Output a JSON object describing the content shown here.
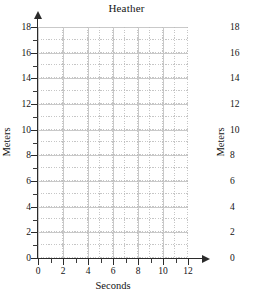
{
  "chart_data": {
    "type": "line",
    "title": "Heather",
    "xlabel": "Seconds",
    "ylabel": "Meters",
    "ylabel_right": "Meters",
    "xlim": [
      0,
      12
    ],
    "ylim": [
      0,
      18
    ],
    "x_major_tick_step": 2,
    "x_minor_tick_step": 1,
    "y_major_tick_step": 2,
    "y_minor_tick_step": 1,
    "grid": true,
    "grid_minor": true,
    "legend": null,
    "series": [],
    "values": [],
    "x": [],
    "categories": [],
    "annotations": [],
    "note": "Empty blank grid; no data plotted",
    "x_tick_labels": [
      "0",
      "2",
      "4",
      "6",
      "8",
      "10",
      "12"
    ],
    "x_tick_values": [
      0,
      2,
      4,
      6,
      8,
      10,
      12
    ],
    "y_tick_labels": [
      "0",
      "2",
      "4",
      "6",
      "8",
      "10",
      "12",
      "14",
      "16",
      "18"
    ],
    "y_tick_values": [
      0,
      2,
      4,
      6,
      8,
      10,
      12,
      14,
      16,
      18
    ],
    "colors": {
      "background": "#ffffff",
      "axis": "#2b2b2b",
      "grid_major": "#c9c9c9",
      "grid_minor": "#bdbdbd",
      "text": "#131313"
    }
  },
  "chart": {
    "title": "Heather",
    "x_axis": {
      "title": "Seconds",
      "labels": [
        "0",
        "2",
        "4",
        "6",
        "8",
        "10",
        "12"
      ]
    },
    "y_axis_left": {
      "title": "Meters",
      "labels": [
        "18",
        "16",
        "14",
        "12",
        "10",
        "8",
        "6",
        "4",
        "2",
        "0"
      ]
    },
    "y_axis_right": {
      "title": "Meters",
      "labels": [
        "18",
        "16",
        "14",
        "12",
        "10",
        "8",
        "6",
        "4",
        "2",
        "0"
      ]
    }
  }
}
